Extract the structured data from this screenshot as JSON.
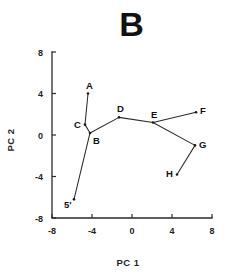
{
  "panel": {
    "title": "B"
  },
  "chart_data": {
    "type": "scatter",
    "title": "B",
    "xlabel": "PC  1",
    "ylabel": "PC  2",
    "xlim": [
      -8,
      8
    ],
    "ylim": [
      -8,
      8
    ],
    "xticks": [
      "-8",
      "-4",
      "0",
      "4",
      "8"
    ],
    "xtick_values": [
      -8,
      -4,
      0,
      4,
      8
    ],
    "yticks": [
      "8",
      "4",
      "0",
      "-4",
      "-8"
    ],
    "ytick_values": [
      8,
      4,
      0,
      -4,
      -8
    ],
    "grid": false,
    "legend": false,
    "points": [
      {
        "label": "5'",
        "x": -5.8,
        "y": -6.2,
        "label_dx": -10,
        "label_dy": 9
      },
      {
        "label": "A",
        "x": -4.4,
        "y": 4.0,
        "label_dx": -2,
        "label_dy": -5
      },
      {
        "label": "C",
        "x": -4.7,
        "y": 1.0,
        "label_dx": -11,
        "label_dy": 3
      },
      {
        "label": "B",
        "x": -4.2,
        "y": 0.2,
        "label_dx": 3,
        "label_dy": 11
      },
      {
        "label": "D",
        "x": -1.3,
        "y": 1.7,
        "label_dx": -2,
        "label_dy": -5
      },
      {
        "label": "E",
        "x": 2.1,
        "y": 1.2,
        "label_dx": -2,
        "label_dy": -5
      },
      {
        "label": "F",
        "x": 6.4,
        "y": 2.2,
        "label_dx": 4,
        "label_dy": 2
      },
      {
        "label": "G",
        "x": 6.3,
        "y": -1.0,
        "label_dx": 4,
        "label_dy": 3
      },
      {
        "label": "H",
        "x": 4.5,
        "y": -3.8,
        "label_dx": -11,
        "label_dy": 3
      }
    ],
    "segments": [
      {
        "from": "5'",
        "to": "B"
      },
      {
        "from": "B",
        "to": "C"
      },
      {
        "from": "C",
        "to": "A"
      },
      {
        "from": "B",
        "to": "D"
      },
      {
        "from": "D",
        "to": "E"
      },
      {
        "from": "E",
        "to": "F"
      },
      {
        "from": "E",
        "to": "G"
      },
      {
        "from": "G",
        "to": "H"
      }
    ],
    "colors": {
      "axis": "#2b2b2b",
      "line": "#2b2b2b",
      "point": "#1a1a1a",
      "text": "#111111",
      "background": "#ffffff"
    }
  }
}
